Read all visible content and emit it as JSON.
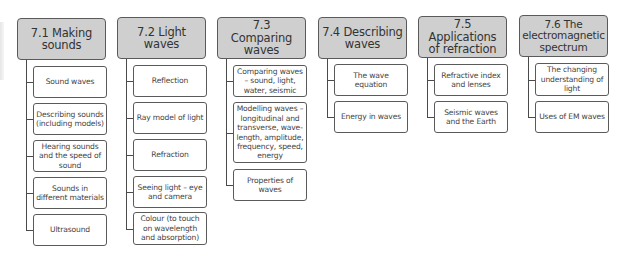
{
  "diagram": {
    "colors": {
      "header_fill": "#cfcfcf",
      "border": "#5a5a5a",
      "connector": "#4a4a4a",
      "child_fill": "#ffffff",
      "text": "#333333"
    },
    "topics": [
      {
        "title": "7.1 Making sounds",
        "items": [
          "Sound waves",
          "Describing sounds (including models)",
          "Hearing sounds and the speed of sound",
          "Sounds in different materials",
          "Ultrasound"
        ]
      },
      {
        "title": "7.2 Light waves",
        "items": [
          "Reflection",
          "Ray model of light",
          "Refraction",
          "Seeing light – eye and camera",
          "Colour (to touch on wavelength and absorption)"
        ]
      },
      {
        "title": "7.3 Comparing waves",
        "items": [
          "Comparing waves – sound, light, water, seismic",
          "Modelling waves – longitudinal and transverse, wave-length, amplitude, frequency, speed, energy",
          "Properties of waves"
        ]
      },
      {
        "title": "7.4 Describing waves",
        "items": [
          "The wave equation",
          "Energy in waves"
        ]
      },
      {
        "title": "7.5 Applications of refraction",
        "items": [
          "Refractive index and lenses",
          "Seismic waves and the Earth"
        ]
      },
      {
        "title": "7.6 The electromagnetic spectrum",
        "items": [
          "The changing understanding of light",
          "Uses of EM waves"
        ]
      }
    ]
  }
}
